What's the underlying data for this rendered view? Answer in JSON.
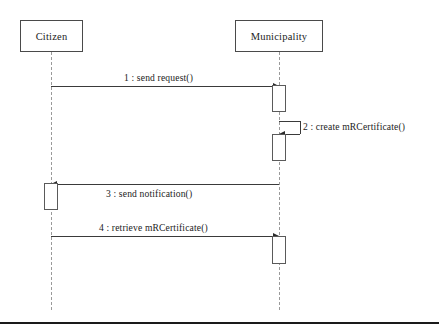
{
  "diagram": {
    "type": "uml-sequence-diagram",
    "title": "",
    "canvas": {
      "width": 439,
      "height": 333,
      "background": "#ffffff"
    },
    "stroke_color": "#3a3a3a",
    "lifeline_color": "#9a9a9a",
    "text_color": "#1c1c1c"
  },
  "participants": [
    {
      "id": "citizen",
      "label": "Citizen",
      "box": {
        "x": 20,
        "y": 20,
        "width": 63,
        "height": 32
      },
      "lifeline_x": 51,
      "lifeline_top": 52,
      "lifeline_bottom": 310
    },
    {
      "id": "municipality",
      "label": "Municipality",
      "box": {
        "x": 235,
        "y": 20,
        "width": 88,
        "height": 32
      },
      "lifeline_x": 279,
      "lifeline_top": 52,
      "lifeline_bottom": 310
    }
  ],
  "messages": [
    {
      "number": "1",
      "label": "1 : send request()",
      "from": "citizen",
      "to": "municipality",
      "direction": "right",
      "y": 86,
      "label_x": 124,
      "label_y": 72,
      "label_position": "above"
    },
    {
      "number": "2",
      "label": "2 : create mRCertificate()",
      "from": "municipality",
      "to": "municipality",
      "direction": "self",
      "y": 121,
      "y_return": 134,
      "loop_right_x": 300,
      "label_x": 303,
      "label_y": 121,
      "label_position": "right"
    },
    {
      "number": "3",
      "label": "3 : send notification()",
      "from": "municipality",
      "to": "citizen",
      "direction": "left",
      "y": 184,
      "label_x": 106,
      "label_y": 188,
      "label_position": "below"
    },
    {
      "number": "4",
      "label": "4 : retrieve mRCertificate()",
      "from": "citizen",
      "to": "municipality",
      "direction": "right",
      "y": 236,
      "label_x": 99,
      "label_y": 222,
      "label_position": "above"
    }
  ],
  "activations": [
    {
      "id": "act-municipality-1",
      "participant": "municipality",
      "x": 272,
      "y": 85,
      "width": 14,
      "height": 27
    },
    {
      "id": "act-municipality-2",
      "participant": "municipality",
      "x": 272,
      "y": 134,
      "width": 14,
      "height": 27
    },
    {
      "id": "act-citizen-1",
      "participant": "citizen",
      "x": 44,
      "y": 183,
      "width": 14,
      "height": 27
    },
    {
      "id": "act-municipality-3",
      "participant": "municipality",
      "x": 272,
      "y": 236,
      "width": 14,
      "height": 28
    }
  ],
  "bottom_rule": {
    "y": 322,
    "width": 439,
    "color": "#1a1a1a"
  }
}
